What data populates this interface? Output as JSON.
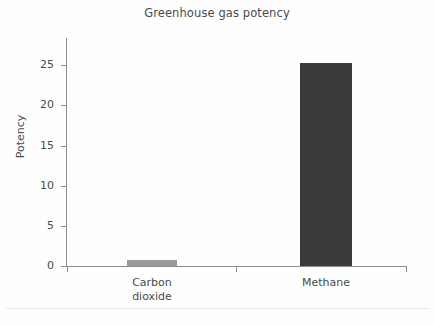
{
  "chart_data": {
    "type": "bar",
    "title": "Greenhouse gas potency",
    "xlabel": "",
    "ylabel": "Potency",
    "categories": [
      "Carbon dioxide",
      "Methane"
    ],
    "category_lines": [
      [
        "Carbon",
        "dioxide"
      ],
      [
        "Methane"
      ]
    ],
    "values": [
      0.7,
      25.4
    ],
    "ylim": [
      0,
      28.5
    ],
    "yticks": [
      0,
      5,
      10,
      15,
      20,
      25
    ],
    "ytick_labels": [
      "0",
      "5",
      "10",
      "15",
      "20",
      "25"
    ],
    "grid": false,
    "legend": null,
    "bar_colors": [
      "#9a9a9a",
      "#3a3a3a"
    ],
    "axis_color": "#8d8d8d",
    "text_color": "#4a4a4a",
    "background": "#fefefe"
  },
  "figure": {
    "title": "Greenhouse gas potency"
  }
}
